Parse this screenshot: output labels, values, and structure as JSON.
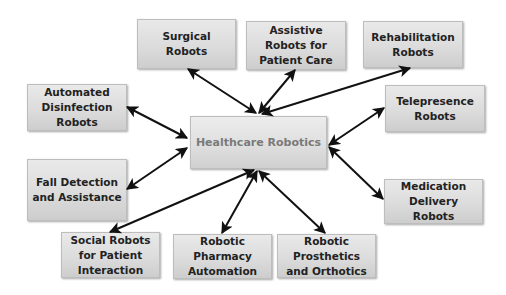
{
  "diagram": {
    "center": {
      "label": "Healthcare Robotics"
    },
    "nodes": [
      {
        "id": "surgical",
        "label": "Surgical Robots"
      },
      {
        "id": "assistive",
        "label": "Assistive Robots for Patient Care"
      },
      {
        "id": "rehabilitation",
        "label": "Rehabilitation Robots"
      },
      {
        "id": "disinfection",
        "label": "Automated Disinfection Robots"
      },
      {
        "id": "telepresence",
        "label": "Telepresence Robots"
      },
      {
        "id": "fall-detection",
        "label": "Fall Detection and Assistance"
      },
      {
        "id": "medication",
        "label": "Medication Delivery Robots"
      },
      {
        "id": "social",
        "label": "Social Robots for Patient Interaction"
      },
      {
        "id": "pharmacy",
        "label": "Robotic Pharmacy Automation"
      },
      {
        "id": "prosthetics",
        "label": "Robotic Prosthetics and Orthotics"
      }
    ],
    "edges": [
      {
        "from": "center",
        "to": "surgical",
        "type": "bidirectional"
      },
      {
        "from": "center",
        "to": "assistive",
        "type": "bidirectional"
      },
      {
        "from": "center",
        "to": "rehabilitation",
        "type": "bidirectional"
      },
      {
        "from": "center",
        "to": "disinfection",
        "type": "bidirectional"
      },
      {
        "from": "center",
        "to": "telepresence",
        "type": "bidirectional"
      },
      {
        "from": "center",
        "to": "fall-detection",
        "type": "bidirectional"
      },
      {
        "from": "center",
        "to": "medication",
        "type": "bidirectional"
      },
      {
        "from": "center",
        "to": "social",
        "type": "bidirectional"
      },
      {
        "from": "center",
        "to": "pharmacy",
        "type": "bidirectional"
      },
      {
        "from": "center",
        "to": "prosthetics",
        "type": "bidirectional"
      }
    ],
    "colors": {
      "node_fill": "#dcdcdc",
      "node_border": "#bdbdbd",
      "node_text": "#222222",
      "center_text": "#7a7a7a",
      "arrow": "#111111"
    }
  }
}
